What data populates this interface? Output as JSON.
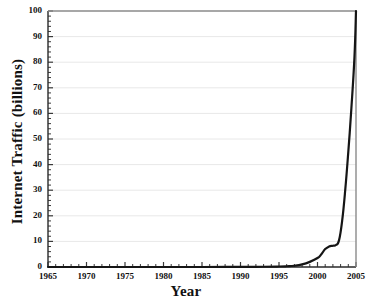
{
  "chart_data": {
    "type": "line",
    "title": "",
    "xlabel": "Year",
    "ylabel": "Internet Traffic (billions)",
    "xlim": [
      1965,
      2005
    ],
    "ylim": [
      0,
      100
    ],
    "grid": true,
    "legend": false,
    "x_ticks": [
      "1965",
      "1970",
      "1975",
      "1980",
      "1985",
      "1990",
      "1995",
      "2000",
      "2005"
    ],
    "x_tick_values": [
      1965,
      1970,
      1975,
      1980,
      1985,
      1990,
      1995,
      2000,
      2005
    ],
    "y_ticks": [
      "0",
      "10",
      "20",
      "30",
      "40",
      "50",
      "60",
      "70",
      "80",
      "90",
      "100"
    ],
    "y_tick_values": [
      0,
      10,
      20,
      30,
      40,
      50,
      60,
      70,
      80,
      90,
      100
    ],
    "x_minor_tick_interval": 1,
    "y_minor_tick_interval": 2,
    "line_color": "#151515",
    "grid_color": "#e8e8e8",
    "axis_color": "#3a3a3a",
    "series": [
      {
        "name": "Internet Traffic",
        "x": [
          1965,
          1970,
          1975,
          1980,
          1985,
          1990,
          1993,
          1995,
          1996,
          1997,
          1998,
          1999,
          2000,
          2000.5,
          2001,
          2001.5,
          2002,
          2002.4,
          2002.8,
          2003.2,
          2003.6,
          2004,
          2004.4,
          2004.8,
          2005
        ],
        "values": [
          0,
          0,
          0,
          0,
          0,
          0.05,
          0.1,
          0.2,
          0.3,
          0.5,
          1.0,
          2.0,
          3.5,
          5.0,
          7.0,
          8.0,
          8.3,
          8.6,
          10.5,
          18,
          30,
          45,
          62,
          82,
          100
        ]
      }
    ]
  }
}
